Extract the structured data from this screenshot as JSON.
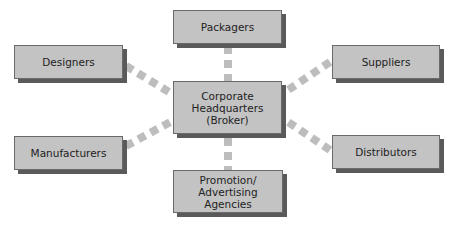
{
  "diagram": {
    "center": {
      "id": "hq",
      "label": "Corporate\nHeadquarters\n(Broker)"
    },
    "nodes": [
      {
        "id": "packagers",
        "label": "Packagers"
      },
      {
        "id": "designers",
        "label": "Designers"
      },
      {
        "id": "suppliers",
        "label": "Suppliers"
      },
      {
        "id": "manufacturers",
        "label": "Manufacturers"
      },
      {
        "id": "distributors",
        "label": "Distributors"
      },
      {
        "id": "promotion",
        "label": "Promotion/\nAdvertising\nAgencies"
      }
    ],
    "edges": [
      {
        "from": "hq",
        "to": "packagers",
        "style": "dashed"
      },
      {
        "from": "hq",
        "to": "designers",
        "style": "dashed"
      },
      {
        "from": "hq",
        "to": "suppliers",
        "style": "dashed"
      },
      {
        "from": "hq",
        "to": "manufacturers",
        "style": "dashed"
      },
      {
        "from": "hq",
        "to": "distributors",
        "style": "dashed"
      },
      {
        "from": "hq",
        "to": "promotion",
        "style": "dashed"
      }
    ],
    "colors": {
      "box_fill": "#c3c3c3",
      "box_border": "#6a6a6a",
      "box_shadow": "#5a5a5a",
      "connector": "#bdbdbd",
      "text": "#222222"
    }
  }
}
